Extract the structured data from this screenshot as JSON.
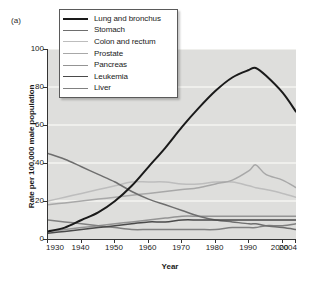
{
  "panel_label": "(a)",
  "legend": {
    "position": "top-left-inside",
    "entries": [
      {
        "label": "Lung and bronchus",
        "color": "#1a1a1a",
        "width": 2.0
      },
      {
        "label": "Stomach",
        "color": "#6e6e6e",
        "width": 1.6
      },
      {
        "label": "Colon and rectum",
        "color": "#bdbdbd",
        "width": 1.6
      },
      {
        "label": "Prostate",
        "color": "#a8a8a8",
        "width": 1.6
      },
      {
        "label": "Pancreas",
        "color": "#949494",
        "width": 1.6
      },
      {
        "label": "Leukemia",
        "color": "#4a4a4a",
        "width": 1.6
      },
      {
        "label": "Liver",
        "color": "#808080",
        "width": 1.6
      }
    ]
  },
  "axes": {
    "y_ticks": [
      "0",
      "20",
      "40",
      "60",
      "80",
      "100"
    ],
    "x_ticks": [
      "1930",
      "1940",
      "1950",
      "1960",
      "1970",
      "1980",
      "1990",
      "2000",
      "2004"
    ]
  },
  "chart_data": {
    "type": "line",
    "title": "",
    "subtitle": "",
    "xlabel": "Year",
    "ylabel": "Rate per 100,000 male population",
    "xlim": [
      1930,
      2004
    ],
    "ylim": [
      0,
      100
    ],
    "yticks": [
      0,
      20,
      40,
      60,
      80,
      100
    ],
    "xticks": [
      1930,
      1940,
      1950,
      1960,
      1970,
      1980,
      1990,
      2000,
      2004
    ],
    "grid": "horizontal-white-gridlines",
    "legend_position": "upper-left-inside",
    "annotations": [
      "(a)"
    ],
    "x": [
      1930,
      1935,
      1940,
      1945,
      1950,
      1955,
      1960,
      1965,
      1970,
      1975,
      1980,
      1985,
      1990,
      1992,
      1995,
      2000,
      2004
    ],
    "series": [
      {
        "name": "Lung and bronchus",
        "color": "#1a1a1a",
        "values": [
          4,
          6,
          10,
          14,
          20,
          28,
          38,
          48,
          59,
          69,
          78,
          85,
          89,
          90,
          86,
          77,
          67
        ]
      },
      {
        "name": "Stomach",
        "color": "#6e6e6e",
        "values": [
          45,
          42,
          38,
          34,
          30,
          25,
          21,
          18,
          15,
          12,
          10,
          9,
          8,
          8,
          7,
          6,
          5
        ]
      },
      {
        "name": "Colon and rectum",
        "color": "#bdbdbd",
        "values": [
          20,
          22,
          24,
          26,
          28,
          30,
          30,
          30,
          29,
          29,
          30,
          30,
          28,
          27,
          26,
          24,
          22
        ]
      },
      {
        "name": "Prostate",
        "color": "#a8a8a8",
        "values": [
          18,
          19,
          20,
          21,
          22,
          23,
          24,
          25,
          26,
          27,
          29,
          31,
          36,
          39,
          34,
          31,
          27
        ]
      },
      {
        "name": "Pancreas",
        "color": "#949494",
        "values": [
          4,
          5,
          6,
          7,
          8,
          9,
          10,
          11,
          12,
          12,
          12,
          12,
          12,
          12,
          12,
          12,
          12
        ]
      },
      {
        "name": "Leukemia",
        "color": "#4a4a4a",
        "values": [
          3,
          4,
          5,
          6,
          7,
          8,
          9,
          9,
          10,
          10,
          10,
          10,
          10,
          10,
          10,
          10,
          10
        ]
      },
      {
        "name": "Liver",
        "color": "#808080",
        "values": [
          10,
          9,
          8,
          7,
          6,
          5,
          5,
          5,
          5,
          5,
          5,
          6,
          6,
          6,
          7,
          7,
          8
        ]
      }
    ]
  }
}
